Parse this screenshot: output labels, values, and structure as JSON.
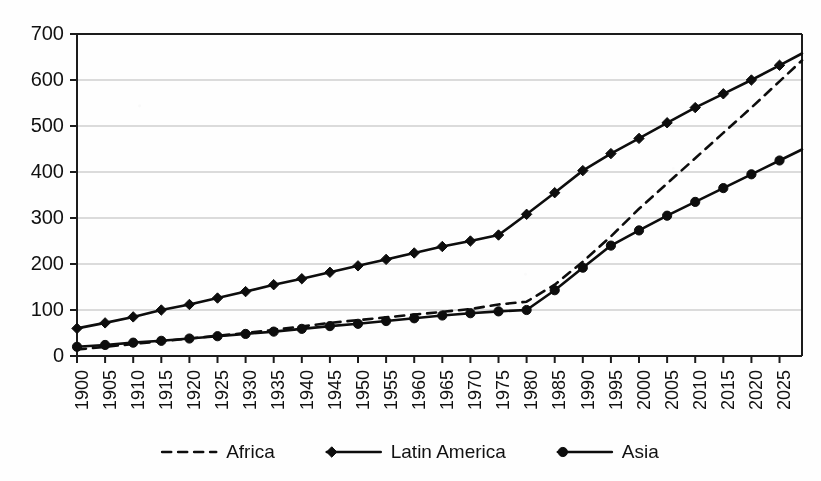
{
  "chart_data": {
    "type": "line",
    "title": "",
    "subtitle": "",
    "xlabel": "",
    "ylabel": "",
    "xlim": [
      1900,
      2029
    ],
    "ylim": [
      0,
      700
    ],
    "ytick_step": 100,
    "grid": true,
    "legend_position": "bottom",
    "y_ticks": [
      0,
      100,
      200,
      300,
      400,
      500,
      600,
      700
    ],
    "categories": [
      "1900",
      "1905",
      "1910",
      "1915",
      "1920",
      "1925",
      "1930",
      "1935",
      "1940",
      "1945",
      "1950",
      "1955",
      "1960",
      "1965",
      "1970",
      "1975",
      "1980",
      "1985",
      "1990",
      "1995",
      "2000",
      "2005",
      "2010",
      "2015",
      "2020",
      "2025"
    ],
    "x": [
      1900,
      1905,
      1910,
      1915,
      1920,
      1925,
      1930,
      1935,
      1940,
      1945,
      1950,
      1955,
      1960,
      1965,
      1970,
      1975,
      1980,
      1985,
      1990,
      1995,
      2000,
      2005,
      2010,
      2015,
      2020,
      2025
    ],
    "series": [
      {
        "name": "Africa",
        "style": "dashed",
        "marker": "none",
        "color": "#0d0d0d",
        "values": [
          14,
          20,
          26,
          32,
          38,
          44,
          50,
          57,
          64,
          72,
          78,
          84,
          90,
          96,
          102,
          112,
          118,
          155,
          205,
          260,
          320,
          375,
          430,
          485,
          540,
          597
        ]
      },
      {
        "name": "Latin America",
        "style": "solid",
        "marker": "diamond",
        "color": "#0d0d0d",
        "values": [
          60,
          72,
          85,
          100,
          112,
          126,
          140,
          155,
          168,
          182,
          196,
          210,
          224,
          238,
          250,
          263,
          308,
          355,
          403,
          440,
          473,
          507,
          540,
          570,
          600,
          632
        ]
      },
      {
        "name": "Asia",
        "style": "solid",
        "marker": "circle",
        "color": "#0d0d0d",
        "values": [
          20,
          24,
          29,
          33,
          38,
          43,
          48,
          53,
          59,
          65,
          70,
          76,
          82,
          88,
          93,
          97,
          100,
          143,
          192,
          240,
          273,
          305,
          335,
          365,
          395,
          425
        ]
      }
    ],
    "legend": [
      {
        "label": "Africa",
        "style": "dashed",
        "marker": "none"
      },
      {
        "label": "Latin America",
        "style": "solid",
        "marker": "diamond"
      },
      {
        "label": "Asia",
        "style": "solid",
        "marker": "circle"
      }
    ]
  }
}
